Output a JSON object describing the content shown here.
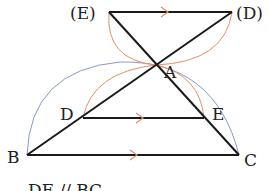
{
  "diagram": {
    "type": "geometry-construction",
    "points": {
      "A": {
        "label": "A",
        "x": 156,
        "y": 65
      },
      "B": {
        "label": "B",
        "x": 27,
        "y": 155
      },
      "C": {
        "label": "C",
        "x": 239,
        "y": 155
      },
      "D": {
        "label": "D",
        "x": 83,
        "y": 118
      },
      "E": {
        "label": "E",
        "x": 204,
        "y": 118
      },
      "E_prime": {
        "label": "(E)",
        "x": 109,
        "y": 12
      },
      "D_prime": {
        "label": "(D)",
        "x": 232,
        "y": 12
      }
    },
    "caption": "DE // BC",
    "colors": {
      "line": "#1a1a1a",
      "orange_arc": "#e0906a",
      "blue_arc": "#8a9ac0",
      "arrow": "#e0906a"
    }
  }
}
